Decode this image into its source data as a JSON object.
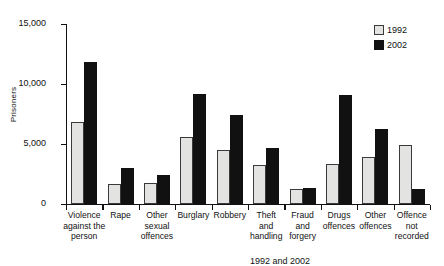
{
  "chart_data": {
    "type": "bar",
    "title": "",
    "xlabel": "",
    "ylabel": "Prisoners",
    "ylim": [
      0,
      15000
    ],
    "yticks": [
      0,
      5000,
      10000,
      15000
    ],
    "ytick_labels": [
      "0",
      "5,000",
      "10,000",
      "15,000"
    ],
    "grid": false,
    "legend_position": "top-right",
    "categories": [
      "Violence against the person",
      "Rape",
      "Other sexual offences",
      "Burglary",
      "Robbery",
      "Theft and handling",
      "Fraud and forgery",
      "Drugs offences",
      "Other offences",
      "Offence not recorded"
    ],
    "category_lines": [
      [
        "Violence",
        "against the",
        "person"
      ],
      [
        "Rape"
      ],
      [
        "Other",
        "sexual",
        "offences"
      ],
      [
        "Burglary"
      ],
      [
        "Robbery"
      ],
      [
        "Theft",
        "and",
        "handling"
      ],
      [
        "Fraud",
        "and",
        "forgery"
      ],
      [
        "Drugs",
        "offences"
      ],
      [
        "Other",
        "offences"
      ],
      [
        "Offence",
        "not",
        "recorded"
      ]
    ],
    "series": [
      {
        "name": "1992",
        "color": "#e3e3e1",
        "values": [
          6800,
          1650,
          1700,
          5600,
          4500,
          3200,
          1250,
          3300,
          3900,
          4900
        ]
      },
      {
        "name": "2002",
        "color": "#111111",
        "values": [
          11800,
          2950,
          2400,
          9150,
          7400,
          4650,
          1300,
          9100,
          6250,
          1200
        ]
      }
    ]
  },
  "legend": {
    "items": [
      {
        "label": "1992",
        "swatch": "legend-swatch-1992"
      },
      {
        "label": "2002",
        "swatch": "legend-swatch-2002"
      }
    ]
  },
  "footer": {
    "text": "1992 and 2002"
  }
}
